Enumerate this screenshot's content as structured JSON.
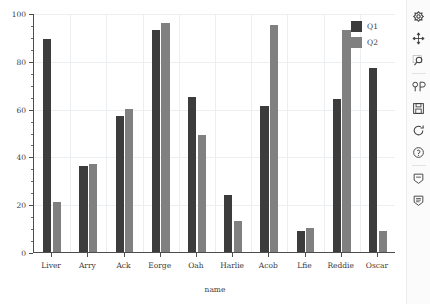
{
  "chart_data": {
    "type": "bar",
    "title": "",
    "xlabel": "name",
    "ylabel": "",
    "categories": [
      "Liver",
      "Arry",
      "Ack",
      "Eorge",
      "Oah",
      "Harlie",
      "Acob",
      "Lfie",
      "Reddie",
      "Oscar"
    ],
    "series": [
      {
        "name": "Q1",
        "color": "#3c3c3c",
        "values": [
          89,
          36,
          57,
          93,
          65,
          24,
          61,
          9,
          64,
          77
        ]
      },
      {
        "name": "Q2",
        "color": "#808080",
        "values": [
          21,
          37,
          60,
          96,
          49,
          13,
          95,
          10,
          93,
          9
        ]
      }
    ],
    "ylim": [
      0,
      100
    ],
    "yticks": [
      0,
      20,
      40,
      60,
      80,
      100
    ],
    "ytick_labels": [
      "0",
      "20",
      "40",
      "60",
      "80",
      "100"
    ],
    "yminor_step": 5,
    "grid": true,
    "legend_position": "upper right"
  },
  "legend": {
    "entries": [
      {
        "label": "Q1",
        "color": "#3c3c3c"
      },
      {
        "label": "Q2",
        "color": "#808080"
      }
    ]
  },
  "toolbar": {
    "items": [
      {
        "name": "home-icon",
        "title": "Home"
      },
      {
        "name": "pan-move-icon",
        "title": "Pan"
      },
      {
        "name": "zoom-magnifier-icon",
        "title": "Zoom to rectangle"
      },
      {
        "name": "subplot-config-icon",
        "title": "Configure subplots"
      },
      {
        "name": "save-disk-icon",
        "title": "Save figure"
      },
      {
        "name": "refresh-icon",
        "title": "Refresh"
      },
      {
        "name": "help-question-icon",
        "title": "Help"
      },
      {
        "name": "annotate-icon",
        "title": "Annotate"
      },
      {
        "name": "annotate-list-icon",
        "title": "Annotations list"
      }
    ]
  }
}
